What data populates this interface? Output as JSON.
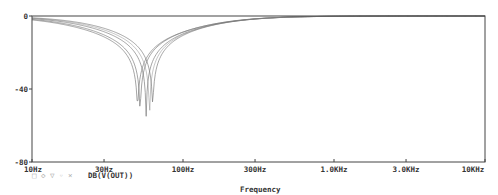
{
  "chart_data": {
    "type": "line",
    "title": "",
    "xlabel": "Frequency",
    "ylabel": "",
    "xscale": "log",
    "xlim": [
      10,
      10000
    ],
    "ylim": [
      -80,
      0
    ],
    "grid": false,
    "x_ticks": [
      {
        "value": 10,
        "label": "10Hz"
      },
      {
        "value": 30,
        "label": "30Hz"
      },
      {
        "value": 100,
        "label": "100Hz"
      },
      {
        "value": 300,
        "label": "300Hz"
      },
      {
        "value": 1000,
        "label": "1.0KHz"
      },
      {
        "value": 3000,
        "label": "3.0KHz"
      },
      {
        "value": 10000,
        "label": "10KHz"
      }
    ],
    "y_ticks": [
      {
        "value": 0,
        "label": "0"
      },
      {
        "value": -40,
        "label": "-40"
      },
      {
        "value": -80,
        "label": "-80"
      }
    ],
    "legend": {
      "position": "bottom-left",
      "entries": [
        {
          "label": "DB(V(OUT))",
          "marker_symbols": "□ ◇ ▽  ◦ ×"
        }
      ]
    },
    "series": [
      {
        "name": "DB(V(OUT)) run 1",
        "notch_hz": 50,
        "notch_db": -50
      },
      {
        "name": "DB(V(OUT)) run 2",
        "notch_hz": 52,
        "notch_db": -53
      },
      {
        "name": "DB(V(OUT)) run 3",
        "notch_hz": 57,
        "notch_db": -55
      },
      {
        "name": "DB(V(OUT)) run 4",
        "notch_hz": 60,
        "notch_db": -73
      },
      {
        "name": "DB(V(OUT)) run 5",
        "notch_hz": 63,
        "notch_db": -48
      }
    ],
    "series_shape": "notch filter response: ~0 dB at 10Hz, falls to deep notch near 50-63Hz, recovers to ~0 dB by ~1kHz"
  },
  "labels": {
    "x_axis_title": "Frequency",
    "legend_label": "DB(V(OUT))",
    "legend_markers": "□ ◇ ▽   ◦ ×"
  },
  "colors": {
    "trace": "#7a7a7a",
    "axis": "#444444",
    "background": "#ffffff"
  }
}
